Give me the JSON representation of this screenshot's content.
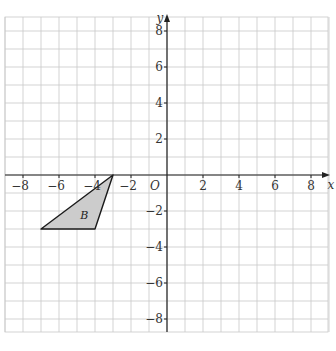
{
  "figure": {
    "corner_mark": "",
    "x_axis_label": "x",
    "y_axis_label": "y",
    "origin_label": "O",
    "shape_label": "B",
    "x_ticks": [
      {
        "v": -8,
        "label": "−8"
      },
      {
        "v": -6,
        "label": "−6"
      },
      {
        "v": -4,
        "label": "−4"
      },
      {
        "v": -2,
        "label": "−2"
      },
      {
        "v": 2,
        "label": "2"
      },
      {
        "v": 4,
        "label": "4"
      },
      {
        "v": 6,
        "label": "6"
      },
      {
        "v": 8,
        "label": "8"
      }
    ],
    "y_ticks": [
      {
        "v": 8,
        "label": "8"
      },
      {
        "v": 6,
        "label": "6"
      },
      {
        "v": 4,
        "label": "4"
      },
      {
        "v": 2,
        "label": "2"
      },
      {
        "v": -2,
        "label": "−2"
      },
      {
        "v": -4,
        "label": "−4"
      },
      {
        "v": -6,
        "label": "−6"
      },
      {
        "v": -8,
        "label": "−8"
      }
    ],
    "triangle_B": [
      [
        -3,
        0
      ],
      [
        -7,
        -3
      ],
      [
        -4,
        -3
      ]
    ],
    "colors": {
      "grid": "#c8c8c8",
      "axis": "#222222",
      "fill": "#cccccc",
      "stroke": "#1a1a1a"
    }
  }
}
